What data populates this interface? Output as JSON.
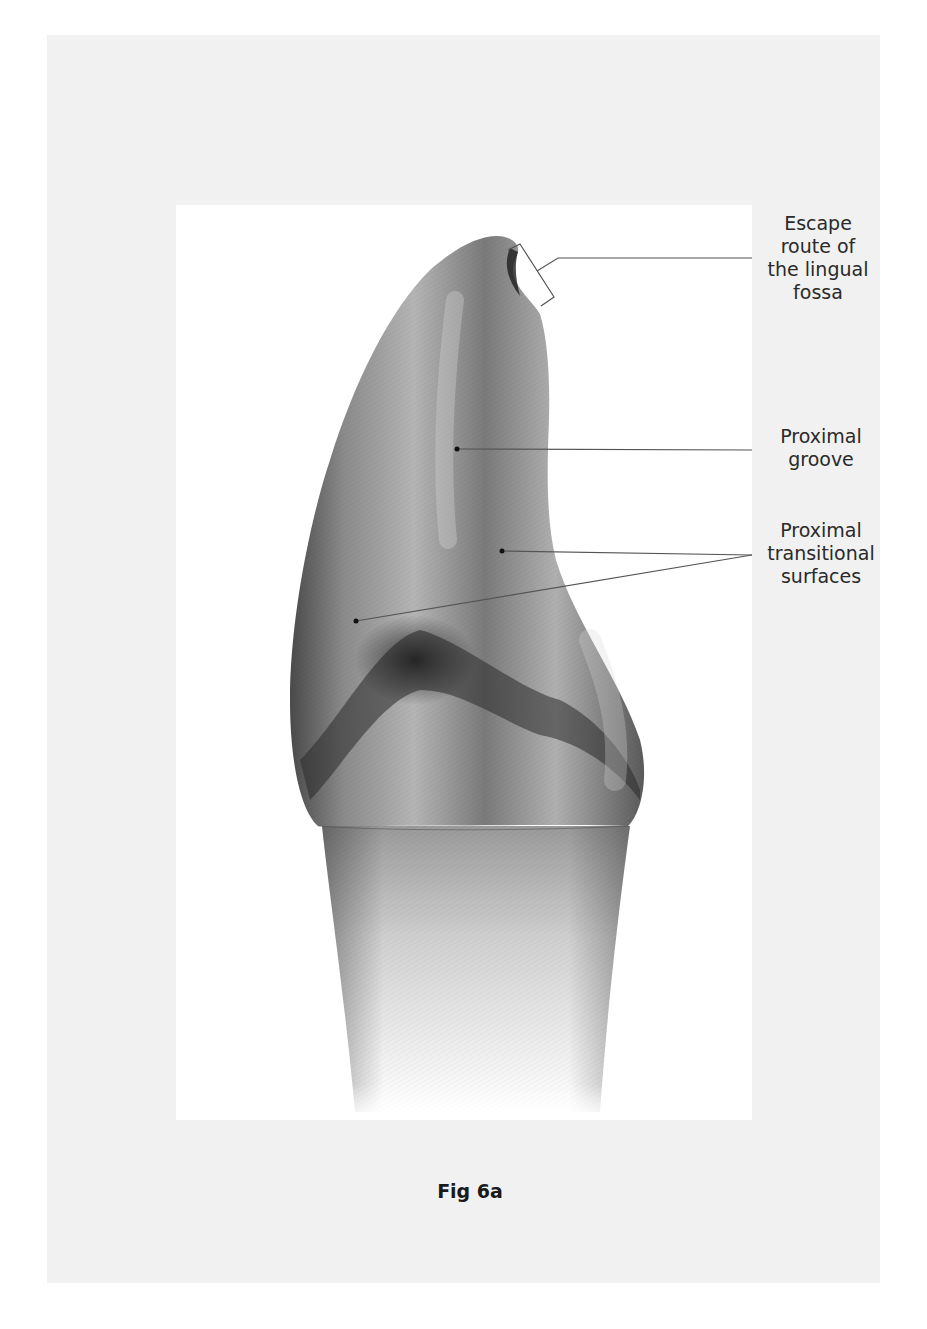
{
  "figure": {
    "caption": "Fig 6a"
  },
  "labels": [
    {
      "id": "escape-route",
      "lines": [
        "Escape",
        "route of",
        "the lingual",
        "fossa"
      ]
    },
    {
      "id": "proximal-groove",
      "lines": [
        "Proximal",
        "groove"
      ]
    },
    {
      "id": "proximal-transitional",
      "lines": [
        "Proximal",
        "transitional",
        "surfaces"
      ]
    }
  ],
  "colors": {
    "panel_bg": "#f1f1f1",
    "inner_bg": "#ffffff",
    "leader_line": "#555555",
    "text": "#2a2a2a"
  }
}
